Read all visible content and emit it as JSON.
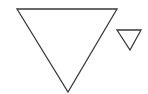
{
  "diagram": {
    "background": "#ffffff",
    "stroke_color": "#3a3a3a",
    "stroke_width": 1.3,
    "shapes": [
      {
        "name": "large-inverted-triangle",
        "points": "17,9 117,9 68,92"
      },
      {
        "name": "small-inverted-triangle",
        "points": "117,30 141,30 130,50"
      }
    ]
  }
}
